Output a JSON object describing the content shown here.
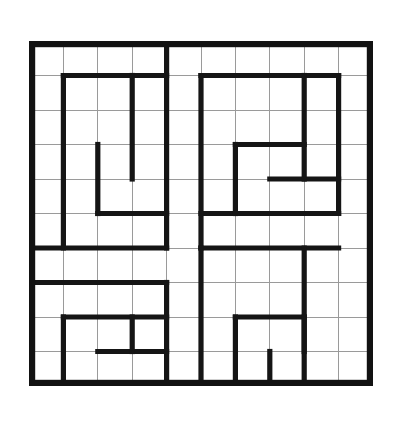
{
  "figure": {
    "kind": "maze-puzzle",
    "title": "",
    "background_color": "#ffffff",
    "wall_color": "#151515",
    "grid_line_color": "#9a9a9a",
    "border_color": "#121212"
  },
  "grid": {
    "columns": 10,
    "rows": 10,
    "cell_size": 34.4,
    "origin_x": 0,
    "origin_y": 0,
    "width": 344,
    "height": 345,
    "grid_visible": true,
    "border_visible": true,
    "border_thickness": 6.2,
    "wall_thickness": 5.2
  },
  "maze": {
    "description": "Ten-by-ten square maze with four interlocking spiral wall motifs, one per quadrant.",
    "horizontal_walls": [
      {
        "name": "tl-spiral-outer-top",
        "row": 1,
        "col_start": 1,
        "col_end": 4
      },
      {
        "name": "tl-spiral-inner-bottom",
        "row": 5,
        "col_start": 2,
        "col_end": 4
      },
      {
        "name": "tl-spiral-foot",
        "row": 6,
        "col_start": 0,
        "col_end": 4
      },
      {
        "name": "tr-spiral-outer-top",
        "row": 1,
        "col_start": 5,
        "col_end": 9
      },
      {
        "name": "tr-spiral-inner-top",
        "row": 3,
        "col_start": 6,
        "col_end": 8
      },
      {
        "name": "tr-spiral-inner-bottom",
        "row": 4,
        "col_start": 7,
        "col_end": 9
      },
      {
        "name": "tr-spiral-bottom",
        "row": 5,
        "col_start": 5,
        "col_end": 9
      },
      {
        "name": "tr-spiral-foot",
        "row": 6,
        "col_start": 5,
        "col_end": 9
      },
      {
        "name": "bl-spiral-top",
        "row": 7,
        "col_start": 0,
        "col_end": 4
      },
      {
        "name": "bl-spiral-inner-top",
        "row": 8,
        "col_start": 1,
        "col_end": 4
      },
      {
        "name": "bl-spiral-inner-bottom",
        "row": 9,
        "col_start": 2,
        "col_end": 4
      },
      {
        "name": "br-spiral-inner-top",
        "row": 8,
        "col_start": 6,
        "col_end": 8
      },
      {
        "name": "br-spiral-inner-bottom",
        "row": 10,
        "col_start": 6,
        "col_end": 8
      }
    ],
    "vertical_walls": [
      {
        "name": "tl-spiral-left",
        "col": 1,
        "row_start": 1,
        "row_end": 6
      },
      {
        "name": "tl-spiral-inner-left",
        "col": 2,
        "row_start": 3,
        "row_end": 5
      },
      {
        "name": "tl-spiral-inner-right",
        "col": 3,
        "row_start": 1,
        "row_end": 4
      },
      {
        "name": "tl-quadrant-divider",
        "col": 4,
        "row_start": 0,
        "row_end": 6
      },
      {
        "name": "tr-spiral-left",
        "col": 5,
        "row_start": 1,
        "row_end": 6
      },
      {
        "name": "tr-spiral-inner-left",
        "col": 6,
        "row_start": 3,
        "row_end": 5
      },
      {
        "name": "tr-spiral-inner-right",
        "col": 8,
        "row_start": 1,
        "row_end": 4
      },
      {
        "name": "tr-spiral-right",
        "col": 9,
        "row_start": 1,
        "row_end": 5
      },
      {
        "name": "bl-spiral-left",
        "col": 1,
        "row_start": 8,
        "row_end": 10
      },
      {
        "name": "bl-spiral-right",
        "col": 4,
        "row_start": 7,
        "row_end": 10
      },
      {
        "name": "bl-spiral-inner-right",
        "col": 3,
        "row_start": 8,
        "row_end": 9
      },
      {
        "name": "bottom-center-divider",
        "col": 5,
        "row_start": 6,
        "row_end": 10
      },
      {
        "name": "br-spiral-inner-left",
        "col": 6,
        "row_start": 8,
        "row_end": 10
      },
      {
        "name": "br-spiral-inner-mid",
        "col": 7,
        "row_start": 9,
        "row_end": 10
      },
      {
        "name": "br-spiral-right",
        "col": 8,
        "row_start": 8,
        "row_end": 9
      },
      {
        "name": "br-spiral-outer-right",
        "col": 8,
        "row_start": 6,
        "row_end": 10
      }
    ]
  }
}
